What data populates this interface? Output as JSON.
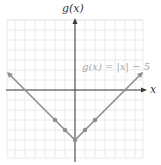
{
  "chart_data": {
    "type": "line",
    "title": "",
    "xlabel": "x",
    "ylabel": "g(x)",
    "function": "g(x) = |x| - 5",
    "annotation": "g(x) = |x| − 5",
    "xlim": [
      -6.8,
      6.8
    ],
    "ylim": [
      -6.8,
      7
    ],
    "grid": true,
    "grid_step": 1,
    "series": [
      {
        "name": "g(x) = |x| − 5",
        "x": [
          -6.7,
          -5,
          -2,
          -1,
          0,
          1,
          2,
          5,
          6.7
        ],
        "y": [
          1.7,
          0,
          -3,
          -4,
          -5,
          -4,
          -3,
          0,
          1.7
        ]
      }
    ],
    "marked_points": [
      {
        "x": -2,
        "y": -3
      },
      {
        "x": -1,
        "y": -4
      },
      {
        "x": 0,
        "y": -5
      },
      {
        "x": 1,
        "y": -4
      },
      {
        "x": 2,
        "y": -3
      }
    ],
    "x_intercepts": [
      -5,
      5
    ],
    "vertex": {
      "x": 0,
      "y": -5
    }
  },
  "labels": {
    "y_axis": "g(x)",
    "x_axis": "x",
    "equation": "g(x) = |x| − 5"
  },
  "colors": {
    "line": "#8e8e8e",
    "grid": "#e4e4e4",
    "axis": "#3a3a3a",
    "equation": "#a8a8a8"
  }
}
